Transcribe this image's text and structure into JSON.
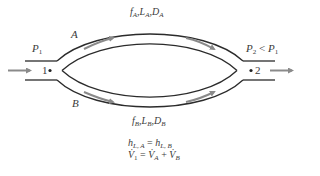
{
  "diagram": {
    "type": "parallel-pipe-system",
    "colors": {
      "pipe": "#2b2b2b",
      "arrow": "#8a8a8a",
      "text": "#3a3a3a",
      "background": "#ffffff"
    },
    "nodes": [
      {
        "id": "1",
        "label": "1",
        "pressure_label": "P",
        "pressure_sub": "1"
      },
      {
        "id": "2",
        "label": "2",
        "pressure_label": "P",
        "pressure_sub": "2",
        "relation": "<",
        "compare_label": "P",
        "compare_sub": "1"
      }
    ],
    "branches": [
      {
        "id": "A",
        "label": "A",
        "props": [
          {
            "sym": "f",
            "sub": "A"
          },
          {
            "sym": "L",
            "sub": "A"
          },
          {
            "sym": "D",
            "sub": "A"
          }
        ]
      },
      {
        "id": "B",
        "label": "B",
        "props": [
          {
            "sym": "f",
            "sub": "B"
          },
          {
            "sym": "L",
            "sub": "B"
          },
          {
            "sym": "D",
            "sub": "B"
          }
        ]
      }
    ],
    "equations": {
      "eq1": {
        "lhs": "h",
        "lhs_sub": "L, A",
        "op": "=",
        "rhs": "h",
        "rhs_sub": "L, B"
      },
      "eq2": {
        "lhs": "V̇",
        "lhs_sub": "1",
        "op": "=",
        "t1": "V̇",
        "t1_sub": "A",
        "plus": "+",
        "t2": "V̇",
        "t2_sub": "B"
      }
    },
    "sep": ","
  }
}
